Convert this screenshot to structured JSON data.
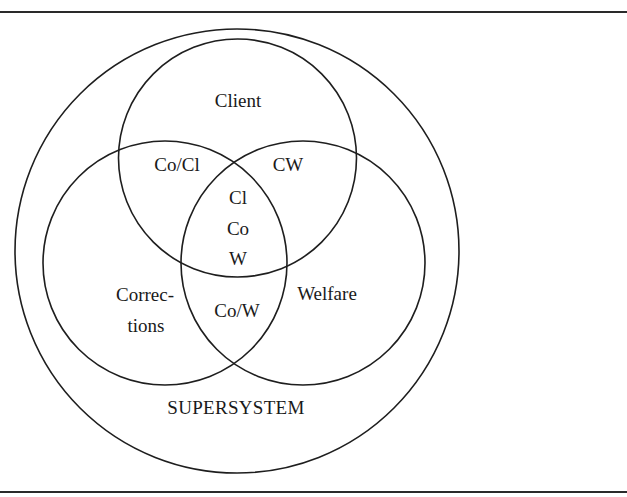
{
  "diagram": {
    "type": "venn",
    "sets": [
      {
        "id": "supersystem",
        "label": "SUPERSYSTEM",
        "role": "enclosing"
      },
      {
        "id": "client",
        "label": "Client"
      },
      {
        "id": "corrections",
        "label": "Correc-\ntions"
      },
      {
        "id": "welfare",
        "label": "Welfare"
      }
    ],
    "labels": {
      "client": "Client",
      "corrections_line1": "Correc-",
      "corrections_line2": "tions",
      "welfare": "Welfare",
      "supersystem": "SUPERSYSTEM",
      "co_cl": "Co/Cl",
      "cw": "CW",
      "co_w": "Co/W",
      "center_line1": "Cl",
      "center_line2": "Co",
      "center_line3": "W"
    },
    "intersections": [
      {
        "sets": [
          "corrections",
          "client"
        ],
        "label": "Co/Cl"
      },
      {
        "sets": [
          "client",
          "welfare"
        ],
        "label": "CW"
      },
      {
        "sets": [
          "corrections",
          "welfare"
        ],
        "label": "Co/W"
      },
      {
        "sets": [
          "client",
          "corrections",
          "welfare"
        ],
        "label": "Cl Co W"
      }
    ],
    "colors": {
      "stroke": "#1e1e1e",
      "text": "#1a1a1a",
      "background": "#ffffff"
    }
  }
}
